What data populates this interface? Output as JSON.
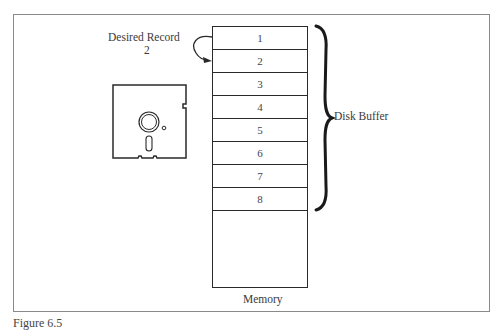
{
  "diagram": {
    "desired_record_label": "Desired Record",
    "desired_record_number": "2",
    "memory_label": "Memory",
    "disk_buffer_label": "Disk Buffer",
    "buffer_rows": [
      "1",
      "2",
      "3",
      "4",
      "5",
      "6",
      "7",
      "8"
    ],
    "caption": "Figure 6.5"
  }
}
